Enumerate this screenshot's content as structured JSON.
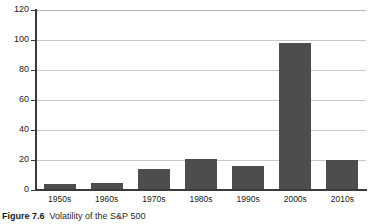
{
  "chart_data": {
    "type": "bar",
    "title": "",
    "xlabel": "",
    "ylabel": "",
    "categories": [
      "1950s",
      "1960s",
      "1970s",
      "1980s",
      "1990s",
      "2000s",
      "2010s"
    ],
    "values": [
      4,
      5,
      14,
      21,
      16,
      98,
      20
    ],
    "ylim": [
      0,
      120
    ],
    "ytick_labels": [
      "0",
      "20",
      "40",
      "60",
      "80",
      "100",
      "120"
    ],
    "ytick_values": [
      0,
      20,
      40,
      60,
      80,
      100,
      120
    ],
    "grid": true,
    "legend": "none",
    "bar_color": "#4d4d4d",
    "gridline_color": "#c9c9c9",
    "axis_color": "#3a3a3a",
    "background_color": "#ffffff"
  },
  "caption": {
    "label": "Figure",
    "number": "7.6",
    "text": "Volatility of the S&P 500"
  }
}
